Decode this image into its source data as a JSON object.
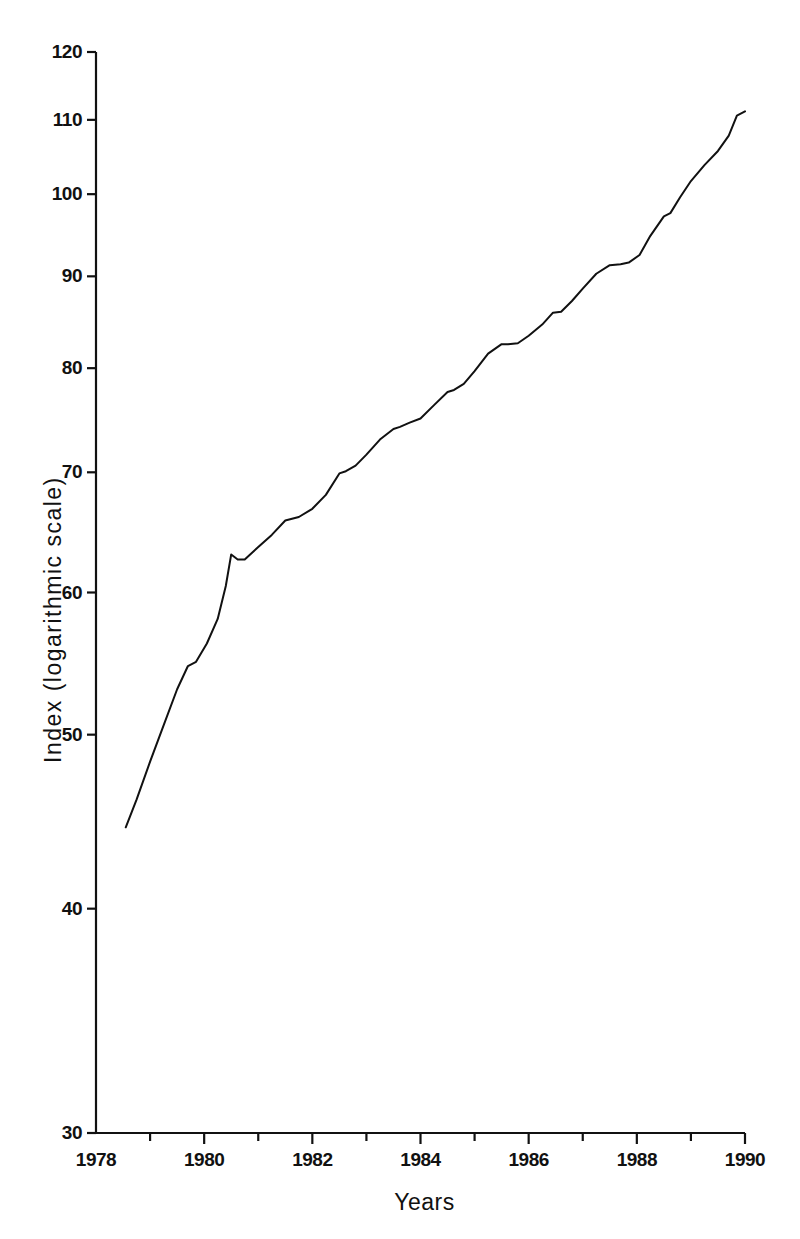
{
  "chart_data": {
    "type": "line",
    "title": "",
    "subtitle": "",
    "xlabel": "Years",
    "ylabel": "Index (logarithmic scale)",
    "yscale": "log",
    "xscale": "linear",
    "grid": false,
    "legend": null,
    "xlim": [
      1978,
      1990
    ],
    "ylim": [
      30,
      120
    ],
    "xticks": [
      1978,
      1979,
      1980,
      1981,
      1982,
      1983,
      1984,
      1985,
      1986,
      1987,
      1988,
      1989,
      1990
    ],
    "xtick_labels": [
      "1978",
      "",
      "1980",
      "",
      "1982",
      "",
      "1984",
      "",
      "1986",
      "",
      "1988",
      "",
      "1990"
    ],
    "xticks_major": [
      1978,
      1980,
      1982,
      1984,
      1986,
      1988,
      1990
    ],
    "xtick_major_labels": [
      "1978",
      "1980",
      "1982",
      "1984",
      "1986",
      "1988",
      "1990"
    ],
    "yticks": [
      30,
      40,
      50,
      60,
      70,
      80,
      90,
      100,
      110,
      120
    ],
    "ytick_labels": [
      "30",
      "40",
      "50",
      "60",
      "70",
      "80",
      "90",
      "100",
      "110",
      "120"
    ],
    "series": [
      {
        "name": "Index",
        "color": "#111111",
        "linewidth": 2,
        "x": [
          1978.55,
          1978.75,
          1979.0,
          1979.25,
          1979.5,
          1979.7,
          1979.85,
          1980.05,
          1980.25,
          1980.4,
          1980.5,
          1980.62,
          1980.75,
          1981.0,
          1981.25,
          1981.5,
          1981.75,
          1982.0,
          1982.25,
          1982.5,
          1982.62,
          1982.8,
          1983.0,
          1983.25,
          1983.5,
          1983.62,
          1983.8,
          1984.0,
          1984.25,
          1984.5,
          1984.62,
          1984.8,
          1985.0,
          1985.25,
          1985.5,
          1985.62,
          1985.8,
          1986.0,
          1986.25,
          1986.45,
          1986.6,
          1986.8,
          1987.0,
          1987.25,
          1987.5,
          1987.7,
          1987.85,
          1988.05,
          1988.25,
          1988.5,
          1988.62,
          1988.8,
          1989.0,
          1989.25,
          1989.5,
          1989.7,
          1989.85,
          1990.0
        ],
        "y": [
          44.4,
          46.0,
          48.3,
          50.6,
          53.0,
          54.6,
          54.9,
          56.2,
          58.0,
          60.5,
          63.0,
          62.6,
          62.6,
          63.6,
          64.6,
          65.8,
          66.1,
          66.8,
          68.0,
          69.9,
          70.1,
          70.6,
          71.6,
          73.0,
          74.0,
          74.2,
          74.6,
          75.0,
          76.3,
          77.6,
          77.8,
          78.4,
          79.7,
          81.5,
          82.5,
          82.5,
          82.6,
          83.4,
          84.6,
          85.9,
          86.0,
          87.2,
          88.6,
          90.3,
          91.3,
          91.4,
          91.6,
          92.5,
          94.8,
          97.2,
          97.6,
          99.6,
          101.7,
          103.8,
          105.7,
          107.8,
          110.6,
          111.2
        ]
      }
    ],
    "annotations": [],
    "axes_style": {
      "spines": [
        "left",
        "bottom"
      ],
      "tick_direction": "out",
      "axis_color": "#111111"
    }
  }
}
